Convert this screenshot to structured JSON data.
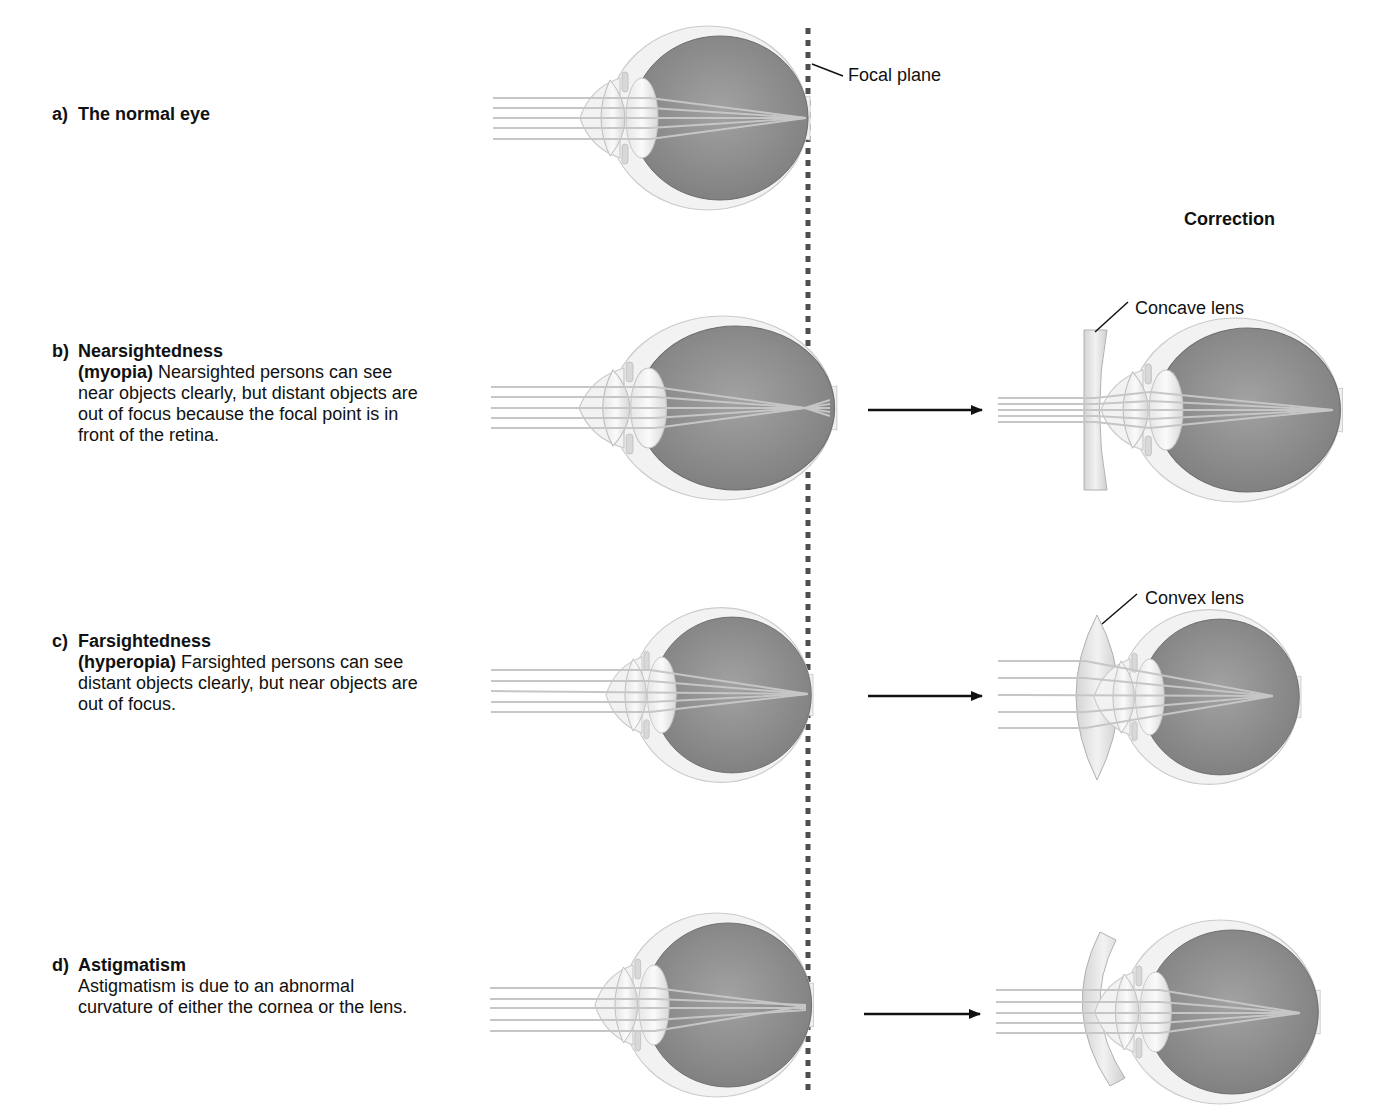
{
  "figure": {
    "focal_plane_label": "Focal plane",
    "correction_title": "Correction",
    "lens_labels": {
      "concave": "Concave lens",
      "convex": "Convex lens"
    },
    "colors": {
      "eyeball_outer": "#f1f1f1",
      "eyeball_outline": "#c8c8c8",
      "vitreous": "#8c8c8c",
      "light_ray": "#c9c9c9",
      "focal_plane": "#555555",
      "arrow": "#111111"
    },
    "panels": [
      {
        "letter": "a)",
        "title": "The normal eye",
        "term": "",
        "description": ""
      },
      {
        "letter": "b)",
        "title": "Nearsightedness",
        "term": "(myopia)",
        "description": " Nearsighted persons can see near objects clearly, but distant objects are out of focus because the focal point is in front of the retina."
      },
      {
        "letter": "c)",
        "title": "Farsightedness",
        "term": "(hyperopia)",
        "description": " Farsighted persons can see distant objects clearly, but near objects are out of focus."
      },
      {
        "letter": "d)",
        "title": "Astigmatism",
        "term": "",
        "description": "Astigmatism is due to an abnormal curvature of either the cornea or the lens."
      }
    ]
  }
}
